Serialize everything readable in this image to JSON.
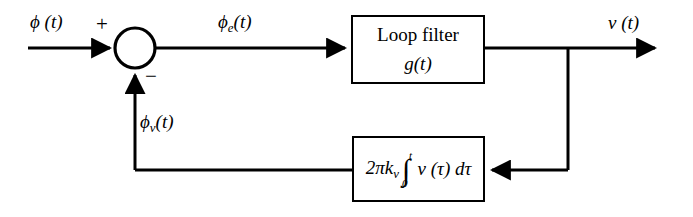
{
  "diagram": {
    "background_color": "#ffffff",
    "line_color": "#000000",
    "signals": {
      "input_label": "ϕ (t)",
      "error_label_base": "ϕ",
      "error_label_sub": "e",
      "error_label_tail": "(t)",
      "output_label": "v (t)",
      "feedback_label_base": "ϕ",
      "feedback_label_sub": "v",
      "feedback_label_tail": "(t)"
    },
    "summing_junction": {
      "name": "summing-junction",
      "plus_sign": "+",
      "minus_sign": "−",
      "center_x": 135,
      "center_y": 48,
      "radius": 20
    },
    "blocks": [
      {
        "id": "loop-filter",
        "title": "Loop filter",
        "subtitle": "g(t)"
      },
      {
        "id": "vco",
        "gain": "2πk",
        "gain_sub": "v",
        "integral_glyph": "∫",
        "limit_upper": "t",
        "limit_lower": "0",
        "integrand": "v (τ) dτ"
      }
    ]
  }
}
